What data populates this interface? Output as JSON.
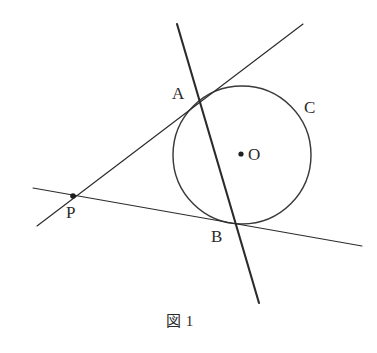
{
  "figure": {
    "caption": "図 1",
    "caption_position": {
      "x": 166,
      "y": 314
    },
    "background_color": "#ffffff",
    "stroke_color": "#2b2b2b",
    "label_color": "#2a2a2a"
  },
  "chart_data": {
    "type": "diagram",
    "title": "図 1",
    "circle": {
      "name": "C",
      "center": {
        "x": 242,
        "y": 155
      },
      "radius": 69,
      "label": "C",
      "label_position": {
        "x": 304,
        "y": 99
      }
    },
    "points": [
      {
        "name": "O",
        "label": "O",
        "x": 241,
        "y": 154,
        "dot": true,
        "label_position": {
          "x": 248,
          "y": 146
        }
      },
      {
        "name": "A",
        "label": "A",
        "x": 201,
        "y": 101,
        "dot": false,
        "label_position": {
          "x": 172,
          "y": 85
        }
      },
      {
        "name": "B",
        "label": "B",
        "x": 232,
        "y": 222,
        "dot": false,
        "label_position": {
          "x": 211,
          "y": 228
        }
      },
      {
        "name": "P",
        "label": "P",
        "x": 73,
        "y": 196,
        "dot": true,
        "label_position": {
          "x": 66,
          "y": 204
        }
      }
    ],
    "lines": [
      {
        "name": "line-AB-steep",
        "from": {
          "x": 177,
          "y": 24
        },
        "to": {
          "x": 259,
          "y": 303
        },
        "weight": "thick",
        "through": [
          "A",
          "B"
        ]
      },
      {
        "name": "line-P-A-secant",
        "from": {
          "x": 37,
          "y": 226
        },
        "to": {
          "x": 303,
          "y": 24
        },
        "weight": "thin",
        "through": [
          "P",
          "A"
        ]
      },
      {
        "name": "line-P-B-secant",
        "from": {
          "x": 33,
          "y": 188
        },
        "to": {
          "x": 362,
          "y": 246
        },
        "weight": "thin",
        "through": [
          "P",
          "B"
        ]
      }
    ]
  }
}
